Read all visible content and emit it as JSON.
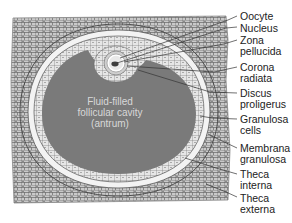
{
  "diagram": {
    "cavity_label": "Fluid-filled\nfollicular cavity\n(antrum)",
    "labels": [
      {
        "id": "oocyte",
        "text": "Oocyte",
        "top": 11
      },
      {
        "id": "nucleus",
        "text": "Nucleus",
        "top": 23
      },
      {
        "id": "zona-pellucida",
        "text": "Zona\npellucida",
        "top": 35
      },
      {
        "id": "corona-radiata",
        "text": "Corona\nradiata",
        "top": 62
      },
      {
        "id": "discus-proligerus",
        "text": "Discus\nproligerus",
        "top": 88
      },
      {
        "id": "granulosa-cells",
        "text": "Granulosa\ncells",
        "top": 114
      },
      {
        "id": "membrana-granulosa",
        "text": "Membrana\ngranulosa",
        "top": 143
      },
      {
        "id": "theca-interna",
        "text": "Theca\ninterna",
        "top": 169
      },
      {
        "id": "theca-externa",
        "text": "Theca\nexterna",
        "top": 193
      }
    ],
    "colors": {
      "cavity": "#7a7a7a",
      "cell_fill": "#d4d4d4",
      "cell_border": "#555555",
      "granulosa_fill": "#efefef",
      "oocyte_fill": "#f2f2f2",
      "nucleus_fill": "#444444",
      "leader_line": "#333333",
      "label_text": "#222222"
    }
  }
}
